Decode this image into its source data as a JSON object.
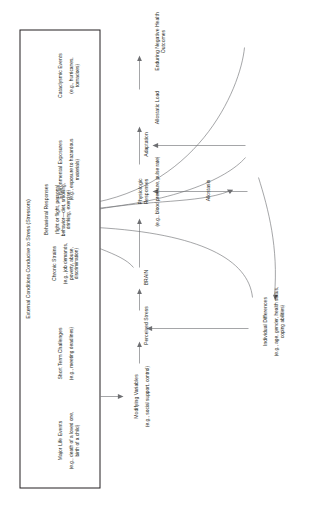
{
  "figure": {
    "type": "flow-diagram",
    "orientation": "rotated-90-ccw",
    "stressor_box": {
      "title": "External Conditions Conducive to Stress (Stressors)",
      "items": [
        {
          "name": "Major Life Events",
          "examples": "(e.g., death of a loved one,\nbirth of a child)"
        },
        {
          "name": "Short Term Challenges",
          "examples": "(e.g., meeting deadlines)"
        },
        {
          "name": "Chronic Strains",
          "examples": "(e.g., job demands,\npoverty, abuse,\ndiscrimination)"
        },
        {
          "name": "Environmental Exposures",
          "examples": "(e.g., exposure to hazardous\nmaterials)"
        },
        {
          "name": "Cataclysmic Events",
          "examples": "(e.g., hurricanes,\ntornadoes)"
        }
      ]
    },
    "nodes": [
      {
        "id": "modifying",
        "name": "Modifying Variables",
        "examples": "(e.g., social support, control)"
      },
      {
        "id": "individual",
        "name": "Individual Differences",
        "examples": "(e.g., age, gender, health status,\ncoping abilities)"
      },
      {
        "id": "perceived",
        "name": "Perceived Stress",
        "examples": ""
      },
      {
        "id": "brain",
        "name": "BRAIN",
        "examples": ""
      },
      {
        "id": "behavioral",
        "name": "Behavioral Responses",
        "examples": "(fight or flight, personal\nbehavior—diet, smoking,\ndrinking, exercise)"
      },
      {
        "id": "physiologic",
        "name": "Physiologic\nResponses",
        "examples": "(e.g., blood pressure, pulse rate)"
      },
      {
        "id": "allostasis",
        "name": "Allostasis",
        "examples": ""
      },
      {
        "id": "adaptation",
        "name": "Adaptation",
        "examples": ""
      },
      {
        "id": "allostatic",
        "name": "Allostatic Load",
        "examples": ""
      },
      {
        "id": "outcomes",
        "name": "Enduring Negative Health Outcomes",
        "examples": ""
      }
    ],
    "colors": {
      "line": "#6d6e71",
      "text": "#231f20",
      "box_border": "#231f20",
      "background": "#ffffff"
    }
  }
}
